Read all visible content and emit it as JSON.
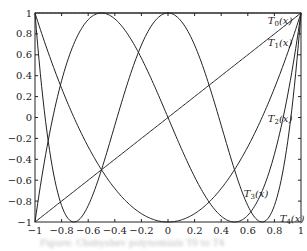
{
  "chart_data": {
    "type": "line",
    "title": "",
    "xlabel": "",
    "ylabel": "",
    "xlim": [
      -1,
      1
    ],
    "ylim": [
      -1,
      1
    ],
    "grid": false,
    "x_ticks": [
      "-1",
      "-0.8",
      "-0.6",
      "-0.4",
      "-0.2",
      "0",
      "0.2",
      "0.4",
      "0.6",
      "0.8",
      "1"
    ],
    "y_ticks": [
      "-1",
      "-0.8",
      "-0.6",
      "-0.4",
      "-0.2",
      "0",
      "0.2",
      "0.4",
      "0.6",
      "0.8",
      "1"
    ],
    "series": [
      {
        "name": "T0(x)",
        "label": "T",
        "sub": "0",
        "formula": "1",
        "x": [
          -1,
          1
        ],
        "values": [
          1,
          1
        ]
      },
      {
        "name": "T1(x)",
        "label": "T",
        "sub": "1",
        "formula": "x",
        "x": [
          -1,
          1
        ],
        "values": [
          -1,
          1
        ]
      },
      {
        "name": "T2(x)",
        "label": "T",
        "sub": "2",
        "formula": "2x^2-1",
        "x": [
          -1,
          -0.5,
          0,
          0.5,
          1
        ],
        "values": [
          1,
          -0.5,
          -1,
          -0.5,
          1
        ]
      },
      {
        "name": "T3(x)",
        "label": "T",
        "sub": "3",
        "formula": "4x^3-3x",
        "x": [
          -1,
          -0.5,
          0,
          0.5,
          1
        ],
        "values": [
          -1,
          1,
          0,
          -1,
          1
        ]
      },
      {
        "name": "T4(x)",
        "label": "T",
        "sub": "4",
        "formula": "8x^4-8x^2+1",
        "x": [
          -1,
          -0.707,
          0,
          0.707,
          1
        ],
        "values": [
          1,
          -1,
          1,
          -1,
          1
        ]
      }
    ],
    "annotations": [
      {
        "text": "T0(x)",
        "x": 0.75,
        "y": 0.93
      },
      {
        "text": "T1(x)",
        "x": 0.75,
        "y": 0.72
      },
      {
        "text": "T2(x)",
        "x": 0.75,
        "y": 0.0
      },
      {
        "text": "T3(x)",
        "x": 0.57,
        "y": -0.72
      },
      {
        "text": "T4(x)",
        "x": 0.84,
        "y": -0.96
      }
    ],
    "legend": "inline labels"
  },
  "caption": "Figure: Chebyshev polynomials T0 to T4"
}
